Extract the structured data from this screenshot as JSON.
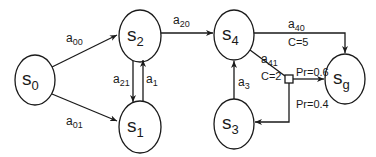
{
  "diagram": {
    "type": "state transition graph",
    "nodes": [
      {
        "id": "s0",
        "base": "s",
        "sub": "0"
      },
      {
        "id": "s1",
        "base": "s",
        "sub": "1"
      },
      {
        "id": "s2",
        "base": "s",
        "sub": "2"
      },
      {
        "id": "s3",
        "base": "s",
        "sub": "3"
      },
      {
        "id": "s4",
        "base": "s",
        "sub": "4"
      },
      {
        "id": "sg",
        "base": "s",
        "sub": "g"
      }
    ],
    "edges": [
      {
        "from": "s0",
        "to": "s2",
        "base": "a",
        "sub": "00"
      },
      {
        "from": "s0",
        "to": "s1",
        "base": "a",
        "sub": "01"
      },
      {
        "from": "s2",
        "to": "s1",
        "base": "a",
        "sub": "21"
      },
      {
        "from": "s1",
        "to": "s2",
        "base": "a",
        "sub": "1"
      },
      {
        "from": "s2",
        "to": "s4",
        "base": "a",
        "sub": "20"
      },
      {
        "from": "s3",
        "to": "s4",
        "base": "a",
        "sub": "3"
      },
      {
        "from": "s4",
        "to": "sg",
        "base": "a",
        "sub": "40",
        "cost": "C=5"
      },
      {
        "from": "s4",
        "to": "chance",
        "base": "a",
        "sub": "41",
        "cost": "C=2"
      }
    ],
    "chance_node": {
      "outcomes": [
        {
          "to": "sg",
          "prob": "Pr=0.6"
        },
        {
          "to": "s3",
          "prob": "Pr=0.4"
        }
      ]
    }
  }
}
